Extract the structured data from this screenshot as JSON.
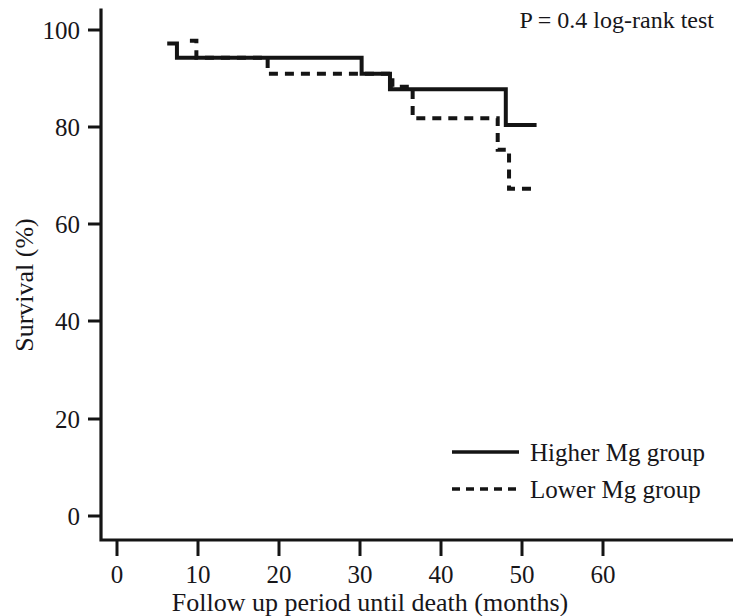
{
  "chart_data": {
    "type": "line",
    "subtype": "kaplan-meier-survival-step",
    "title": "",
    "xlabel": "Follow up period until death (months)",
    "ylabel": "Survival (%)",
    "xlim": [
      0,
      62
    ],
    "ylim": [
      0,
      104
    ],
    "xticks": [
      0,
      10,
      20,
      30,
      40,
      50,
      60
    ],
    "xtick_labels": [
      "0",
      "10",
      "20",
      "30",
      "40",
      "50",
      "60"
    ],
    "yticks": [
      0,
      20,
      40,
      60,
      80,
      100
    ],
    "ytick_labels": [
      "0",
      "20",
      "40",
      "60",
      "80",
      "100"
    ],
    "grid": false,
    "legend_position": "bottom-right",
    "annotations": [
      {
        "name": "p-value-annotation",
        "text": "P = 0.4 log-rank test",
        "x": 40,
        "y": 101
      }
    ],
    "series": [
      {
        "name": "Higher Mg group",
        "style": "solid",
        "color": "#141414",
        "steps": [
          {
            "time": 6.2,
            "survival": 97.4
          },
          {
            "time": 7.4,
            "survival": 94.5
          },
          {
            "time": 30.2,
            "survival": 91.2
          },
          {
            "time": 33.7,
            "survival": 88.0
          },
          {
            "time": 41.0,
            "survival": 88.0
          },
          {
            "time": 48.0,
            "survival": 80.6
          },
          {
            "time": 51.8,
            "survival": 80.6
          }
        ]
      },
      {
        "name": "Lower Mg group",
        "style": "dashed",
        "color": "#141414",
        "steps": [
          {
            "time": 9.0,
            "survival": 98.0
          },
          {
            "time": 9.8,
            "survival": 94.5
          },
          {
            "time": 18.6,
            "survival": 91.2
          },
          {
            "time": 26.5,
            "survival": 91.2
          },
          {
            "time": 31.4,
            "survival": 91.2
          },
          {
            "time": 34.0,
            "survival": 88.5
          },
          {
            "time": 36.5,
            "survival": 82.0
          },
          {
            "time": 45.3,
            "survival": 82.0
          },
          {
            "time": 47.0,
            "survival": 75.5
          },
          {
            "time": 48.4,
            "survival": 67.5
          },
          {
            "time": 51.5,
            "survival": 67.5
          }
        ]
      }
    ]
  },
  "axes": {
    "y_title": "Survival (%)",
    "x_title": "Follow up period until death (months)"
  },
  "legend": {
    "entries": [
      {
        "label": "Higher Mg group",
        "style": "solid"
      },
      {
        "label": "Lower Mg group",
        "style": "dashed"
      }
    ]
  },
  "statistics": {
    "p_text": "P = 0.4 log-rank test"
  }
}
